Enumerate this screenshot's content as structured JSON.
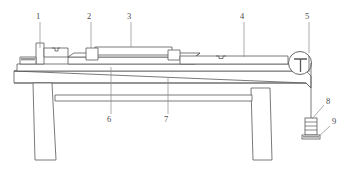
{
  "figure": {
    "background_color": "#ffffff",
    "line_color": "#58585a",
    "shade_color": "#9a9a9c",
    "label_color": "#4a4a4a",
    "width": 344,
    "height": 175
  },
  "callouts": [
    {
      "id": "callout-1",
      "label": "1",
      "text_x": 38,
      "text_y": 19,
      "leader_x": 40,
      "leader_y1": 22,
      "leader_y2": 48
    },
    {
      "id": "callout-2",
      "label": "2",
      "text_x": 89,
      "text_y": 19,
      "leader_x": 91,
      "leader_y1": 22,
      "leader_y2": 52
    },
    {
      "id": "callout-3",
      "label": "3",
      "text_x": 129,
      "text_y": 19,
      "leader_x": 131,
      "leader_y1": 22,
      "leader_y2": 51
    },
    {
      "id": "callout-4",
      "label": "4",
      "text_x": 242,
      "text_y": 19,
      "leader_x": 244,
      "leader_y1": 22,
      "leader_y2": 59
    },
    {
      "id": "callout-5",
      "label": "5",
      "text_x": 307,
      "text_y": 19,
      "leader_x": 309,
      "leader_y1": 22,
      "leader_y2": 53
    },
    {
      "id": "callout-6",
      "label": "6",
      "text_x": 109,
      "text_y": 118,
      "leader_x": 111,
      "leader_y1": 114,
      "leader_y2": 67
    },
    {
      "id": "callout-7",
      "label": "7",
      "text_x": 166,
      "text_y": 118,
      "leader_x": 168,
      "leader_y1": 114,
      "leader_y2": 78
    },
    {
      "id": "callout-8",
      "label": "8",
      "text_x": 326,
      "text_y": 103,
      "leader_x1": 324,
      "leader_y1": 105,
      "leader_x2": 312,
      "leader_y2": 118
    },
    {
      "id": "callout-9",
      "label": "9",
      "text_x": 331,
      "text_y": 123,
      "leader_x1": 329,
      "leader_y1": 125,
      "leader_x2": 317,
      "leader_y2": 135
    }
  ],
  "parts": {
    "bench_top": "workbench-top-slab",
    "bench_leg_left": "workbench-leg-left",
    "bench_leg_right": "workbench-leg-right",
    "bench_rail": "workbench-cross-rail",
    "base_plate": "machine-base-plate",
    "slide_bed": "slide-bed",
    "carriage": "carriage-block",
    "upper_rail": "upper-guide-rail",
    "end_stop_left": "left-end-stop",
    "small_block_left": "left-small-block",
    "long_rail_right": "right-long-rail",
    "pulley": "pulley-wheel",
    "pulley_bracket": "pulley-bracket",
    "cord": "cord-line",
    "weight_hanger": "weight-hanger",
    "weight_stack": "weight-stack",
    "weight_base": "weight-base-plate"
  }
}
